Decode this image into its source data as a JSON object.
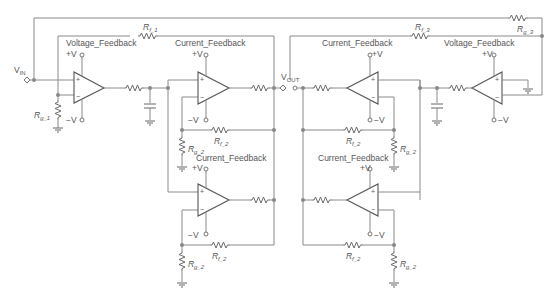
{
  "diagram": {
    "type": "circuit-schematic",
    "nodes": {
      "input": {
        "label": "V",
        "sub": "IN"
      },
      "output": {
        "label": "V",
        "sub": "OUT"
      }
    },
    "opamps": [
      {
        "id": "U1",
        "type_label": "Voltage_Feedback",
        "supply_pos": "+V",
        "supply_neg": "−V"
      },
      {
        "id": "U2",
        "type_label": "Current_Feedback",
        "supply_pos": "+V",
        "supply_neg": "−V"
      },
      {
        "id": "U3",
        "type_label": "Current_Feedback",
        "supply_pos": "+V",
        "supply_neg": "−V"
      },
      {
        "id": "U4",
        "type_label": "Current_Feedback",
        "supply_pos": "+V",
        "supply_neg": "−V"
      },
      {
        "id": "U5",
        "type_label": "Current_Feedback",
        "supply_pos": "+V",
        "supply_neg": "−V"
      },
      {
        "id": "U6",
        "type_label": "Voltage_Feedback",
        "supply_pos": "+V",
        "supply_neg": "−V"
      }
    ],
    "resistors": {
      "rf1": {
        "label": "R",
        "sub": "f_1"
      },
      "rg1": {
        "label": "R",
        "sub": "g_1"
      },
      "rf2": {
        "label": "R",
        "sub": "f_2"
      },
      "rg2": {
        "label": "R",
        "sub": "g_2"
      },
      "rf3": {
        "label": "R",
        "sub": "f_3"
      },
      "rg3": {
        "label": "R",
        "sub": "g_3"
      }
    },
    "pins": {
      "plus": "+",
      "minus": "−"
    }
  }
}
